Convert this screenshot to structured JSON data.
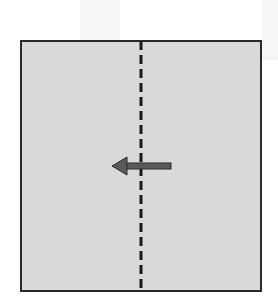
{
  "diagram": {
    "type": "fold-instruction",
    "square": {
      "fill": "#d9d9d9",
      "border": "#2a2a2a"
    },
    "fold_line": {
      "style": "dashed",
      "orientation": "vertical",
      "color": "#1a1a1a"
    },
    "arrow": {
      "direction": "left",
      "color": "#5a5a5a",
      "outline": "#2a2a2a"
    }
  }
}
